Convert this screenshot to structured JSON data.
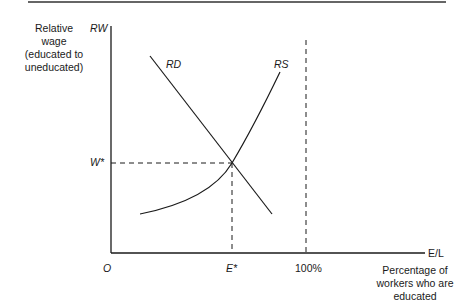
{
  "diagram": {
    "type": "supply-demand",
    "y_axis": {
      "symbol": "RW",
      "description_lines": [
        "Relative",
        "wage",
        "(educated to",
        "uneducated)"
      ]
    },
    "x_axis": {
      "symbol": "E/L",
      "origin": "O",
      "description_lines": [
        "Percentage of",
        "workers who are",
        "educated"
      ]
    },
    "curves": {
      "demand": "RD",
      "supply": "RS"
    },
    "equilibrium": {
      "wage_label": "W*",
      "quantity_label": "E*"
    },
    "limit_label": "100%"
  },
  "colors": {
    "line": "#1a1a1a",
    "background": "#ffffff"
  }
}
